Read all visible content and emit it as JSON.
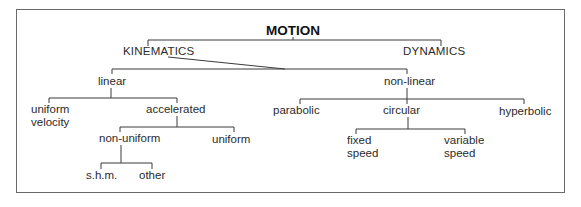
{
  "diagram": {
    "root": "MOTION",
    "level1": {
      "kinematics": "KINEMATICS",
      "dynamics": "DYNAMICS"
    },
    "level2": {
      "linear": "linear",
      "non_linear": "non-linear"
    },
    "linear_children": {
      "uniform_velocity": "uniform\nvelocity",
      "accelerated": "accelerated"
    },
    "accelerated_children": {
      "non_uniform": "non-uniform",
      "uniform": "uniform"
    },
    "non_uniform_children": {
      "shm": "s.h.m.",
      "other": "other"
    },
    "non_linear_children": {
      "parabolic": "parabolic",
      "circular": "circular",
      "hyperbolic": "hyperbolic"
    },
    "circular_children": {
      "fixed_speed": "fixed\nspeed",
      "variable_speed": "variable\nspeed"
    },
    "colors": {
      "line": "#3a3a3a",
      "text": "#2b2b2b",
      "frame": "#6a6a6a"
    }
  }
}
